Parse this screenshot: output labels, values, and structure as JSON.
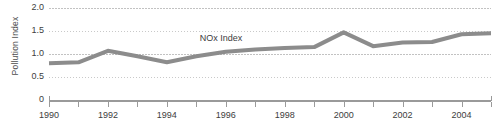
{
  "chart_data": {
    "type": "line",
    "title": "",
    "xlabel": "",
    "ylabel": "Pollution Index",
    "xlim": [
      1990,
      2005
    ],
    "ylim": [
      0,
      2.0
    ],
    "grid": true,
    "legend_position": "inline-annotation",
    "x_tick_labels": [
      "1990",
      "1992",
      "1994",
      "1996",
      "1998",
      "2000",
      "2002",
      "2004"
    ],
    "x_tick_values": [
      1990,
      1991,
      1992,
      1993,
      1994,
      1995,
      1996,
      1997,
      1998,
      1999,
      2000,
      2001,
      2002,
      2003,
      2004,
      2005
    ],
    "y_tick_labels": [
      "2.0",
      "1.5",
      "1.0",
      "0.5",
      "0"
    ],
    "y_tick_values": [
      2.0,
      1.5,
      1.0,
      0.5,
      0
    ],
    "annotations": [
      {
        "text": "NOx Index",
        "x": 1996,
        "y": 1.32
      }
    ],
    "series": [
      {
        "name": "NOx Index",
        "color": "#8c8c8c",
        "x": [
          1990,
          1991,
          1992,
          1993,
          1994,
          1995,
          1996,
          1997,
          1998,
          1999,
          2000,
          2001,
          2002,
          2003,
          2004,
          2005
        ],
        "values": [
          0.8,
          0.82,
          1.07,
          0.95,
          0.82,
          0.95,
          1.05,
          1.1,
          1.13,
          1.15,
          1.47,
          1.17,
          1.25,
          1.26,
          1.43,
          1.45
        ]
      }
    ]
  },
  "axis": {
    "y_title": "Pollution Index"
  }
}
